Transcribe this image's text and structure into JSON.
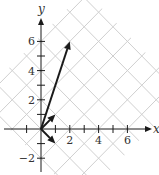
{
  "chart_data": {
    "type": "line",
    "title": "",
    "xlabel": "x",
    "ylabel": "y",
    "xlim": [
      -2.6,
      7.5
    ],
    "ylim": [
      -2.9,
      7.5
    ],
    "x_ticks": [
      -1,
      1,
      2,
      3,
      4,
      5,
      6
    ],
    "x_tick_labels": [
      {
        "value": 2,
        "label": "2"
      },
      {
        "value": 4,
        "label": "4"
      },
      {
        "value": 6,
        "label": "6"
      }
    ],
    "y_ticks": [
      -2,
      -1,
      1,
      2,
      3,
      4,
      5,
      6
    ],
    "y_tick_labels": [
      {
        "value": -2,
        "label": "−2"
      },
      {
        "value": 2,
        "label": "2"
      },
      {
        "value": 4,
        "label": "4"
      },
      {
        "value": 6,
        "label": "6"
      }
    ],
    "grid": "rotated 45° lattice of lines y = x + c and y = -x + c",
    "grid_line_spacing_units": 2,
    "vectors": [
      {
        "name": "long-vector",
        "from": [
          0,
          0
        ],
        "to": [
          2,
          6
        ]
      },
      {
        "name": "vector-up-right",
        "from": [
          0,
          0
        ],
        "to": [
          1,
          1
        ]
      },
      {
        "name": "vector-down-right",
        "from": [
          0,
          0
        ],
        "to": [
          1,
          -1
        ]
      }
    ],
    "colors": {
      "grid": "#cfcfcf",
      "axes": "#1a1a1a",
      "vectors": "#1a1a1a"
    }
  }
}
